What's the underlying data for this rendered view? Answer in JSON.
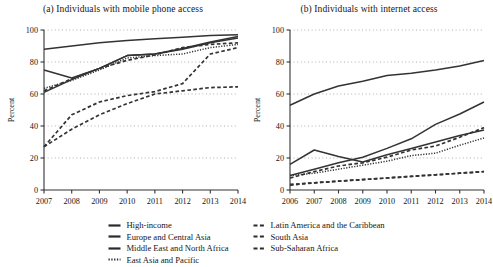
{
  "figure": {
    "ylabel": "Percent",
    "axis_color": "#333333",
    "grid_color": "#9a9a9a",
    "series_color": "#333333"
  },
  "chart_data": [
    {
      "type": "line",
      "panel": "a",
      "title": "(a) Individuals with mobile phone access",
      "xlabel": "",
      "ylabel": "Percent",
      "x": [
        2007,
        2008,
        2009,
        2010,
        2011,
        2012,
        2013,
        2014
      ],
      "categories": [
        "2007",
        "2008",
        "2009",
        "2010",
        "2011",
        "2012",
        "2013",
        "2014"
      ],
      "xlim": [
        2007,
        2014
      ],
      "ylim": [
        0,
        100
      ],
      "yticks": [
        0,
        20,
        40,
        60,
        80,
        100
      ],
      "grid": true,
      "legend": "bottom",
      "series": [
        {
          "name": "High-income",
          "style": "solid",
          "values": [
            88,
            90,
            92,
            93.5,
            94.5,
            95.5,
            96.5,
            97
          ]
        },
        {
          "name": "Europe and Central Asia",
          "style": "solid",
          "values": [
            75,
            70,
            76,
            84,
            85,
            88.5,
            92.5,
            96
          ]
        },
        {
          "name": "Middle East and North Africa",
          "style": "solid",
          "values": [
            61,
            69,
            76,
            84,
            85,
            88,
            92,
            95
          ]
        },
        {
          "name": "East Asia and Pacific",
          "style": "dotted",
          "values": [
            63.5,
            68.5,
            75,
            82.5,
            84,
            85,
            89,
            91
          ]
        },
        {
          "name": "Latin America and the Caribbean",
          "style": "dashed",
          "values": [
            62,
            69.5,
            76,
            81,
            84.5,
            89,
            91,
            92
          ]
        },
        {
          "name": "South Asia",
          "style": "dashed",
          "values": [
            27,
            47,
            55,
            59,
            61.5,
            66.5,
            85,
            89
          ]
        },
        {
          "name": "Sub-Saharan Africa",
          "style": "dashed",
          "values": [
            27,
            38,
            47,
            54,
            60,
            62,
            64,
            64.5
          ]
        }
      ]
    },
    {
      "type": "line",
      "panel": "b",
      "title": "(b) Individuals with internet access",
      "xlabel": "",
      "ylabel": "Percent",
      "x": [
        2006,
        2007,
        2008,
        2009,
        2010,
        2011,
        2012,
        2013,
        2014
      ],
      "categories": [
        "2006",
        "2007",
        "2008",
        "2009",
        "2010",
        "2011",
        "2012",
        "2013",
        "2014"
      ],
      "xlim": [
        2006,
        2014
      ],
      "ylim": [
        0,
        100
      ],
      "yticks": [
        0,
        20,
        40,
        60,
        80,
        100
      ],
      "grid": true,
      "legend": "bottom",
      "series": [
        {
          "name": "High-income",
          "style": "solid",
          "values": [
            53,
            60,
            65,
            68,
            71.5,
            73,
            75,
            77.5,
            81
          ]
        },
        {
          "name": "Europe and Central Asia",
          "style": "solid",
          "values": [
            9,
            13,
            17,
            20.5,
            26,
            32,
            41,
            47.5,
            55
          ]
        },
        {
          "name": "Middle East and North Africa",
          "style": "solid",
          "values": [
            16,
            25,
            21,
            17.5,
            22,
            26,
            30,
            34,
            37.5
          ]
        },
        {
          "name": "East Asia and Pacific",
          "style": "dotted",
          "values": [
            9,
            10.5,
            13,
            15.5,
            18,
            21.5,
            23,
            28,
            32.5
          ]
        },
        {
          "name": "Latin America and the Caribbean",
          "style": "dashed",
          "values": [
            7.5,
            11.5,
            15,
            17,
            20.5,
            25,
            27.5,
            33,
            39
          ]
        },
        {
          "name": "South Asia",
          "style": "dashed",
          "values": [
            3,
            4.5,
            5.5,
            6.5,
            7.5,
            8.5,
            9.5,
            10.5,
            11.5
          ]
        },
        {
          "name": "Sub-Saharan Africa",
          "style": "dashed",
          "values": [
            3.5,
            4.5,
            5.5,
            6.5,
            7.5,
            8.5,
            9.5,
            10.5,
            11.5
          ]
        }
      ]
    }
  ],
  "legend": {
    "left_column": [
      {
        "label": "High-income",
        "style": "solid"
      },
      {
        "label": "Europe and Central Asia",
        "style": "solid"
      },
      {
        "label": "Middle East and North Africa",
        "style": "solid"
      },
      {
        "label": "East Asia and Pacific",
        "style": "dotted"
      }
    ],
    "right_column": [
      {
        "label": "Latin America and the Caribbean",
        "style": "dashed"
      },
      {
        "label": "South Asia",
        "style": "dashed"
      },
      {
        "label": "Sub-Saharan Africa",
        "style": "dashed"
      }
    ]
  }
}
